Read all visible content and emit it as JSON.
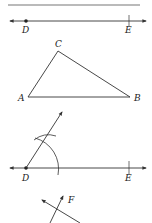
{
  "figure": {
    "top_rule": true,
    "line_de_top": {
      "labels": {
        "d": "D",
        "e": "E"
      }
    },
    "triangle": {
      "labels": {
        "a": "A",
        "b": "B",
        "c": "C"
      }
    },
    "construction": {
      "labels": {
        "d": "D",
        "e": "E"
      }
    },
    "final": {
      "labels": {
        "f": "F"
      }
    },
    "colors": {
      "stroke": "#333333",
      "rule": "#777777",
      "background": "#ffffff"
    }
  }
}
